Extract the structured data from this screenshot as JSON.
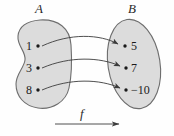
{
  "figure": {
    "type": "function-mapping-diagram",
    "background_color": "#fefefe",
    "blob_fill_color": "#dcdcdc",
    "blob_stroke_color": "#6e6e6e",
    "arrow_color": "#3c3c3c",
    "text_color": "#1a1a1a"
  },
  "sets": {
    "domain": {
      "label": "A",
      "shape": "kidney-blob",
      "elements": [
        {
          "value": "1"
        },
        {
          "value": "3"
        },
        {
          "value": "8"
        }
      ]
    },
    "codomain": {
      "label": "B",
      "shape": "tilted-oval",
      "elements": [
        {
          "value": "5"
        },
        {
          "value": "7"
        },
        {
          "value": "−10"
        }
      ]
    }
  },
  "function": {
    "name": "f",
    "arrow_direction": "right",
    "mappings": [
      {
        "from": "1",
        "to": "5"
      },
      {
        "from": "3",
        "to": "7"
      },
      {
        "from": "8",
        "to": "−10"
      }
    ]
  }
}
